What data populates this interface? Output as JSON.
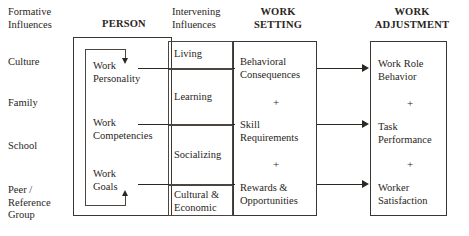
{
  "diagram": {
    "columns": [
      {
        "id": "formative",
        "header": "Formative\nInfluences"
      },
      {
        "id": "person",
        "header": "PERSON"
      },
      {
        "id": "intervening",
        "header": "Intervening\nInfluences"
      },
      {
        "id": "setting",
        "header": "WORK\nSETTING"
      },
      {
        "id": "adjustment",
        "header": "WORK\nADJUSTMENT"
      }
    ],
    "formative_influences": {
      "header": "Formative\nInfluences",
      "items": [
        {
          "label": "Culture"
        },
        {
          "label": "Family"
        },
        {
          "label": "School"
        },
        {
          "label": "Peer /\nReference\nGroup"
        }
      ]
    },
    "person": {
      "header": "PERSON",
      "items": [
        {
          "label": "Work\nPersonality"
        },
        {
          "label": "Work\nCompetencies"
        },
        {
          "label": "Work\nGoals"
        }
      ],
      "feedback_loop": "internal-feedback-loop"
    },
    "intervening_influences": {
      "header": "Intervening\nInfluences",
      "items": [
        {
          "label": "Living"
        },
        {
          "label": "Learning"
        },
        {
          "label": "Socializing"
        },
        {
          "label": "Cultural &\nEconomic"
        }
      ]
    },
    "work_setting": {
      "header": "WORK\nSETTING",
      "items": [
        {
          "label": "Behavioral\nConsequences"
        },
        {
          "label": "Skill\nRequirements"
        },
        {
          "label": "Rewards &\nOpportunities"
        }
      ],
      "separators": [
        "+",
        "+"
      ]
    },
    "work_adjustment": {
      "header": "WORK\nADJUSTMENT",
      "items": [
        {
          "label": "Work Role\nBehavior"
        },
        {
          "label": "Task\nPerformance"
        },
        {
          "label": "Worker\nSatisfaction"
        }
      ],
      "separators": [
        "+",
        "+"
      ]
    },
    "colors": {
      "ink": "#2a2622",
      "rule": "#3a3632",
      "background": "#ffffff"
    }
  }
}
